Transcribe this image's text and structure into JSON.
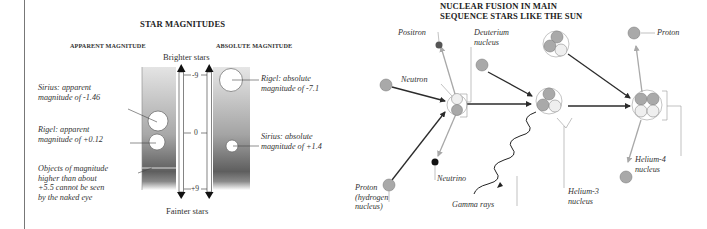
{
  "star_magnitudes": {
    "title": "STAR MAGNITUDES",
    "apparent_header": "APPARENT MAGNITUDE",
    "absolute_header": "ABSOLUTE MAGNITUDE",
    "top_label": "Brighter stars",
    "bottom_label": "Fainter stars",
    "scale_ticks": [
      "-9",
      "0",
      "+9"
    ],
    "labels": {
      "sirius_apparent": [
        "Sirius: apparent",
        "magnitude of -1.46"
      ],
      "rigel_apparent": [
        "Rigel: apparent",
        "magnitude of +0.12"
      ],
      "naked_eye": [
        "Objects of magnitude",
        "higher than about",
        "+5.5 cannot be seen",
        "by the naked eye"
      ],
      "rigel_absolute": [
        "Rigel: absolute",
        "magnitude of -7.1"
      ],
      "sirius_absolute": [
        "Sirius: absolute",
        "magnitude of +1.4"
      ]
    }
  },
  "fusion": {
    "title": [
      "NUCLEAR FUSION IN MAIN",
      "SEQUENCE STARS LIKE THE SUN"
    ],
    "labels": {
      "positron": "Positron",
      "deuterium": [
        "Deuterium",
        "nucleus"
      ],
      "neutron": "Neutron",
      "proton_hydrogen": [
        "Proton",
        "(hydrogen",
        "nucleus)"
      ],
      "neutrino": "Neutrino",
      "gamma_rays": "Gamma rays",
      "helium3": [
        "Helium-3",
        "nucleus"
      ],
      "helium4": [
        "Helium-4",
        "nucleus"
      ],
      "proton": "Proton"
    }
  },
  "colors": {
    "proton": "#a9a9a9",
    "neutron": "#efefef",
    "arrow_dark": "#2b2b2b",
    "arrow_light": "#a8a8a8",
    "positron": "#555555",
    "neutrino": "#111111"
  }
}
